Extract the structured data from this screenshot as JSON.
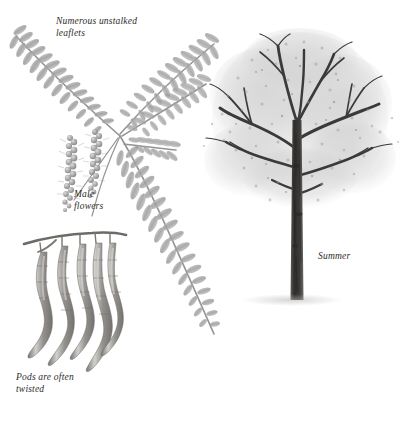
{
  "plate": {
    "medium": "greyscale pencil and wash botanical illustration",
    "background_color": "#ffffff",
    "ink_color": "#2e2c2a",
    "width": 417,
    "height": 423
  },
  "captions": {
    "leaflets": "Numerous unstalked\nleaflets",
    "male_flowers": "Male\nflowers",
    "pods": "Pods are often\ntwisted",
    "summer": "Summer"
  },
  "specimens": {
    "foliage": {
      "name": "pinnate-compound-leaf-spray",
      "leaflet_color": "#a3a3a3",
      "leaflet_highlight": "#cfcfcf",
      "rachis_color": "#8c8c8c",
      "fronds": [
        {
          "name": "upper-left-frond",
          "x1": 16,
          "y1": 36,
          "x2": 116,
          "y2": 134,
          "leaflets": 22,
          "leaflet_len": 15
        },
        {
          "name": "upper-right-frond-a",
          "x1": 214,
          "y1": 44,
          "x2": 118,
          "y2": 128,
          "leaflets": 20,
          "leaflet_len": 14
        },
        {
          "name": "upper-right-frond-b",
          "x1": 206,
          "y1": 82,
          "x2": 120,
          "y2": 134,
          "leaflets": 18,
          "leaflet_len": 13
        },
        {
          "name": "right-arching-frond",
          "x1": 124,
          "y1": 140,
          "x2": 214,
          "y2": 334,
          "leaflets": 26,
          "leaflet_len": 16
        },
        {
          "name": "short-mid-frond",
          "x1": 176,
          "y1": 150,
          "x2": 126,
          "y2": 146,
          "leaflets": 12,
          "leaflet_len": 11
        }
      ]
    },
    "catkins": {
      "name": "male-flower-catkins",
      "color": "#9d9d9d",
      "items": [
        {
          "name": "catkin-left",
          "x": 72,
          "y_top": 136,
          "y_bottom": 214,
          "width": 11
        },
        {
          "name": "catkin-right",
          "x": 96,
          "y_top": 130,
          "y_bottom": 200,
          "width": 10
        }
      ]
    },
    "pods": {
      "name": "twisted-seed-pods",
      "color": "#8f8c88",
      "twig": {
        "x1": 24,
        "y1": 243,
        "x2": 124,
        "y2": 233
      },
      "items": [
        {
          "name": "pod-1",
          "x": 40,
          "y_top": 246,
          "y_bottom": 356,
          "twist": 1
        },
        {
          "name": "pod-2",
          "x": 62,
          "y_top": 240,
          "y_bottom": 368,
          "twist": 2
        },
        {
          "name": "pod-3",
          "x": 80,
          "y_top": 238,
          "y_bottom": 360,
          "twist": 1
        },
        {
          "name": "pod-4",
          "x": 95,
          "y_top": 236,
          "y_bottom": 372,
          "twist": 2
        },
        {
          "name": "pod-5",
          "x": 110,
          "y_top": 236,
          "y_bottom": 352,
          "twist": 1
        }
      ]
    },
    "tree": {
      "name": "summer-tree-habit",
      "season": "Summer",
      "canopy": {
        "cx": 300,
        "cy": 118,
        "rx": 88,
        "ry": 88,
        "top": 33,
        "bottom": 212,
        "left": 224,
        "right": 402
      },
      "foliage_color": "#bdbdbd",
      "branch_color": "#3a3a3a",
      "trunk": {
        "x": 297,
        "y_top": 120,
        "y_bottom": 300,
        "top_width": 9,
        "base_width": 12,
        "color": "#4a4846"
      },
      "ground_shadow": {
        "cx": 292,
        "cy": 300,
        "rx": 48,
        "ry": 5,
        "color": "#c9c9c9"
      }
    }
  }
}
